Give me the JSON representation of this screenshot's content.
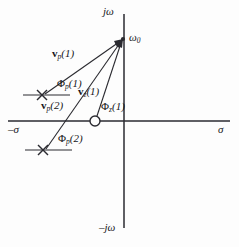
{
  "figure": {
    "type": "s-plane pole-zero diagram",
    "background_color": "#fdfdfd",
    "line_color": "#2a2a30",
    "axes": {
      "vertical_top_label": "jω",
      "vertical_bottom_label": "–jω",
      "horizontal_left_label": "–σ",
      "horizontal_right_label": "σ",
      "origin_px": [
        124,
        121
      ]
    },
    "evaluation_point": {
      "label": "ω",
      "label_sub": "0",
      "px": [
        123,
        39
      ]
    },
    "poles": [
      {
        "name": "pole-1",
        "marker": "x",
        "px": [
          42,
          95
        ]
      },
      {
        "name": "pole-2",
        "marker": "x",
        "px": [
          43,
          150
        ]
      }
    ],
    "zeros": [
      {
        "name": "zero-1",
        "marker": "o",
        "px": [
          95,
          121
        ]
      }
    ],
    "vectors": [
      {
        "name": "vector-pole-1",
        "symbol": "v",
        "sub": "p",
        "arg": "(1)",
        "label": "v<sub>p</sub>(1)",
        "from_px": [
          42,
          95
        ],
        "to_px": [
          123,
          39
        ],
        "label_px": [
          52,
          52
        ]
      },
      {
        "name": "vector-pole-2",
        "symbol": "v",
        "sub": "p",
        "arg": "(2)",
        "label": "v<sub>p</sub>(2)",
        "from_px": [
          43,
          150
        ],
        "to_px": [
          123,
          39
        ],
        "label_px": [
          43,
          103
        ]
      },
      {
        "name": "vector-zero-1",
        "symbol": "v",
        "sub": "z",
        "arg": "(1)",
        "label": "v<sub>z</sub>(1)",
        "from_px": [
          95,
          121
        ],
        "to_px": [
          123,
          39
        ],
        "label_px": [
          80,
          90
        ]
      }
    ],
    "angles": [
      {
        "name": "angle-pole-1",
        "symbol": "Φ",
        "sub": "p",
        "arg": "(1)",
        "label_px": [
          57,
          81
        ]
      },
      {
        "name": "angle-pole-2",
        "symbol": "Φ",
        "sub": "p",
        "arg": "(2)",
        "label_px": [
          58,
          136
        ]
      },
      {
        "name": "angle-zero-1",
        "symbol": "Φ",
        "sub": "z",
        "arg": "(1)",
        "label_px": [
          103,
          104
        ]
      }
    ],
    "labels": {
      "v": "v",
      "p": "p",
      "z": "z",
      "one": "(1)",
      "two": "(2)",
      "phi": "Φ",
      "omega": "ω",
      "zero_sub": "0",
      "jw": "jω",
      "neg_jw": "–jω",
      "neg_sigma": "–σ",
      "sigma": "σ"
    }
  }
}
